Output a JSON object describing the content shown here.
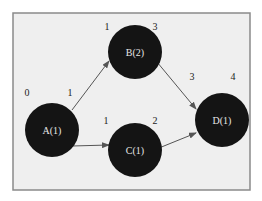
{
  "diagram": {
    "type": "activity-on-node network",
    "colors": {
      "background": "#efefef",
      "frame": "#8a8a8a",
      "node_fill": "#141414",
      "node_text": "#e6e6e6",
      "edge": "#555555",
      "label_text": "#222222"
    },
    "nodes": [
      {
        "id": "A",
        "label": "A(1)",
        "start": "0",
        "finish": "1"
      },
      {
        "id": "B",
        "label": "B(2)",
        "start": "1",
        "finish": "3"
      },
      {
        "id": "C",
        "label": "C(1)",
        "start": "1",
        "finish": "2"
      },
      {
        "id": "D",
        "label": "D(1)",
        "start": "3",
        "finish": "4"
      }
    ],
    "edges": [
      {
        "from": "A",
        "to": "B"
      },
      {
        "from": "A",
        "to": "C"
      },
      {
        "from": "B",
        "to": "D"
      },
      {
        "from": "C",
        "to": "D"
      }
    ]
  }
}
